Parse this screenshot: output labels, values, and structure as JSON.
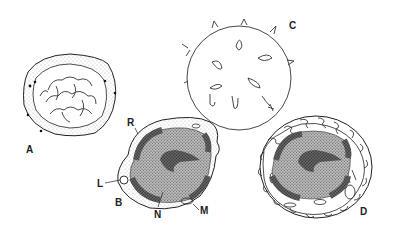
{
  "figure": {
    "panels": [
      {
        "id": "A",
        "label": "A",
        "description": "cell with folded inner membrane and dotted outer rim"
      },
      {
        "id": "B",
        "label": "B",
        "description": "cell cross-section with nucleus and organelles"
      },
      {
        "id": "C",
        "label": "C",
        "description": "spiky spherical cell outline"
      },
      {
        "id": "D",
        "label": "D",
        "description": "cell cross-section with convoluted outer membrane"
      }
    ],
    "annotations": {
      "R": "R",
      "L": "L",
      "N": "N",
      "M": "M"
    },
    "colors": {
      "ink": "#222222",
      "background": "#ffffff",
      "stipple": "#9a9a9a"
    }
  }
}
